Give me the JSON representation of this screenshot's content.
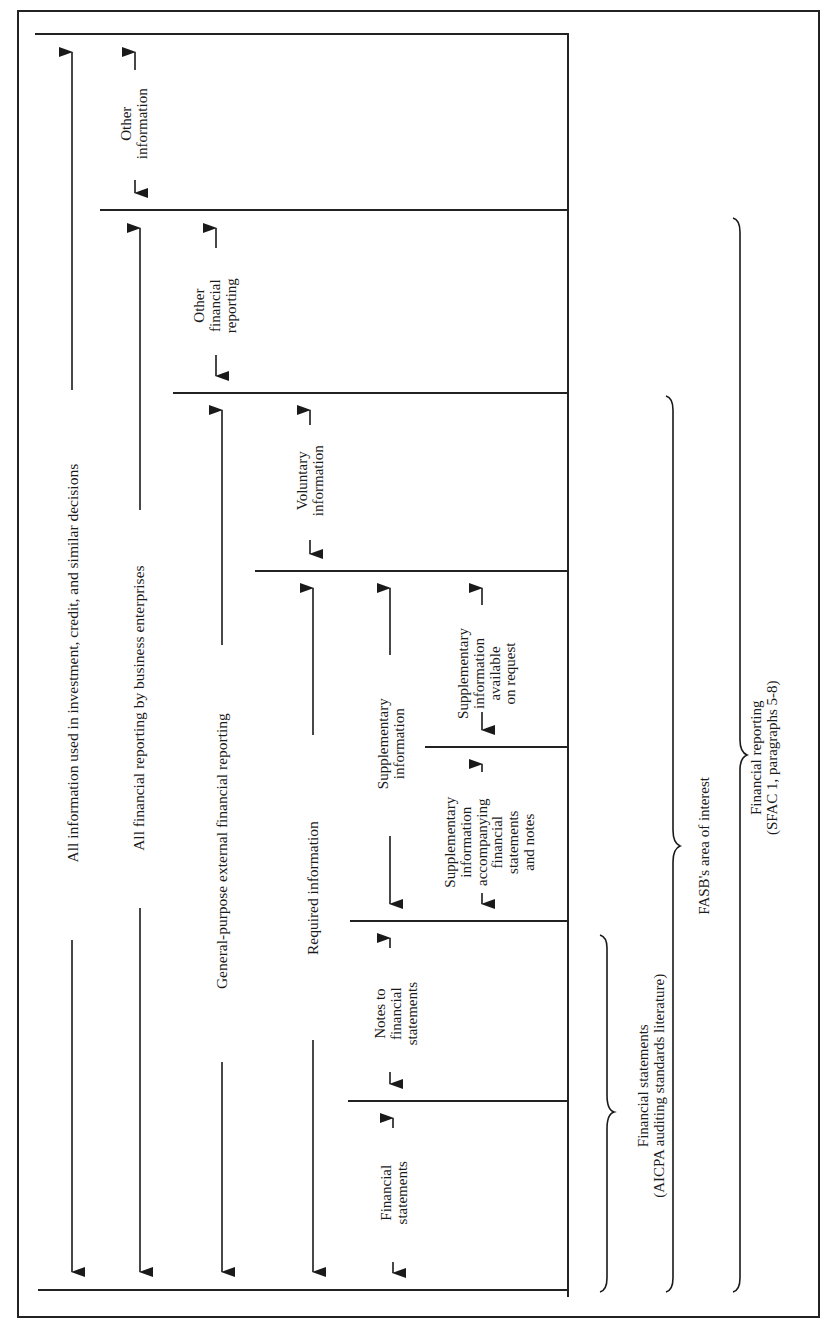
{
  "diagram": {
    "type": "nested-scope-diagram",
    "orientation": "rotated-90-ccw",
    "levels": [
      {
        "id": "all-info",
        "label": "All information used in investment, credit, and similar decisions"
      },
      {
        "id": "all-fin-reporting",
        "label": "All financial reporting by business enterprises"
      },
      {
        "id": "general-purpose",
        "label": "General-purpose external financial reporting"
      },
      {
        "id": "required-info",
        "label": "Required information"
      }
    ],
    "segments": {
      "other_information": "Other\ninformation",
      "other_financial_reporting": "Other\nfinancial\nreporting",
      "voluntary_information": "Voluntary\ninformation",
      "supplementary_information": "Supplementary\ninformation",
      "supplementary_on_request": "Supplementary\ninformation\navailable\non request",
      "supplementary_accompanying": "Supplementary\ninformation\naccompanying\nfinancial\nstatements and notes",
      "notes_to_fs": "Notes to\nfinancial\nstatements",
      "financial_statements": "Financial\nstatements"
    },
    "braces": [
      {
        "id": "fs-brace",
        "label_line1": "Financial  statements",
        "label_line2": "(AICPA auditing standards literature)"
      },
      {
        "id": "fasb-brace",
        "label_line1": "FASB's area of interest"
      },
      {
        "id": "fr-brace",
        "label_line1": "Financial  reporting",
        "label_line2": "(SFAC 1, paragraphs 5-8)"
      }
    ],
    "caption_fragment": "...of Financial Reporting (Site for Is C..."
  },
  "labels": {
    "all_info": "All information used in investment, credit, and similar decisions",
    "all_fin": "All financial reporting by business enterprises",
    "gp": "General-purpose external financial reporting",
    "req": "Required information",
    "other_info_1": "Other",
    "other_info_2": "information",
    "ofr_1": "Other",
    "ofr_2": "financial",
    "ofr_3": "reporting",
    "vol_1": "Voluntary",
    "vol_2": "information",
    "supp_1": "Supplementary",
    "supp_2": "information",
    "req_1": "Supplementary",
    "req_2": "information",
    "req_3": "available",
    "req_4": "on request",
    "acc_1": "Supplementary",
    "acc_2": "information",
    "acc_3": "accompanying",
    "acc_4": "financial",
    "acc_5": "statements",
    "acc_6": "and notes",
    "notes_1": "Notes to",
    "notes_2": "financial",
    "notes_3": "statements",
    "fs_1": "Financial",
    "fs_2": "statements",
    "brace_fs_1": "Financial  statements",
    "brace_fs_2": "(AICPA auditing standards literature)",
    "brace_fasb": "FASB's area of interest",
    "brace_fr_1": "Financial  reporting",
    "brace_fr_2": "(SFAC 1, paragraphs 5-8)",
    "caption": "...of Financial Reporting (Site for Is C..."
  }
}
